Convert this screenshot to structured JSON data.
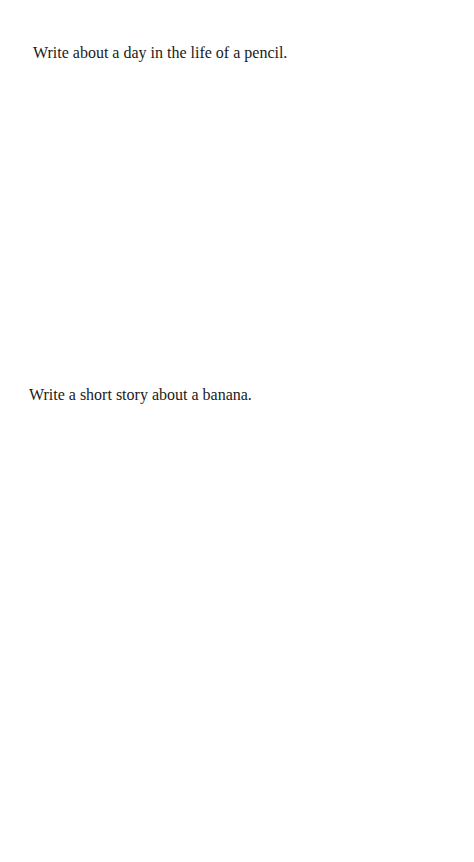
{
  "document": {
    "prompts": [
      {
        "text": "Write about a day in the life of a pencil."
      },
      {
        "text": "Write a short story about a banana."
      }
    ]
  }
}
